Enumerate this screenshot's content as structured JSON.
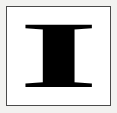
{
  "canvas": {
    "width": 117,
    "height": 113,
    "background_color": "#f2f2f0"
  },
  "frame": {
    "name": "glyph-border-box",
    "border_color": "#4a4a4a",
    "fill_color": "#ffffff",
    "border_width_px": 1,
    "inset_px": 6
  },
  "glyph": {
    "character": "I",
    "description": "bold serif capital letter I",
    "color": "#000000",
    "weight": "bold",
    "style": "serif",
    "case": "uppercase",
    "alignment": "center"
  }
}
